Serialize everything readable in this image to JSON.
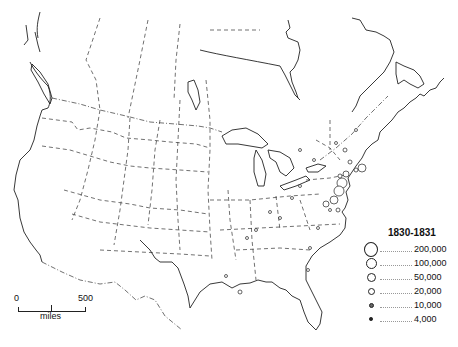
{
  "map": {
    "region": "North America",
    "legend": {
      "title": "1830-1831",
      "entries": [
        {
          "label": "200,000",
          "size": 14
        },
        {
          "label": "100,000",
          "size": 10
        },
        {
          "label": "50,000",
          "size": 8
        },
        {
          "label": "20,000",
          "size": 6
        },
        {
          "label": "10,000",
          "size": 4
        },
        {
          "label": "4,000",
          "size": 2
        }
      ]
    },
    "scale_bar": {
      "start_label": "0",
      "end_label": "500",
      "unit": "miles"
    },
    "colors": {
      "background": "#ffffff",
      "lines": "#222222"
    }
  }
}
